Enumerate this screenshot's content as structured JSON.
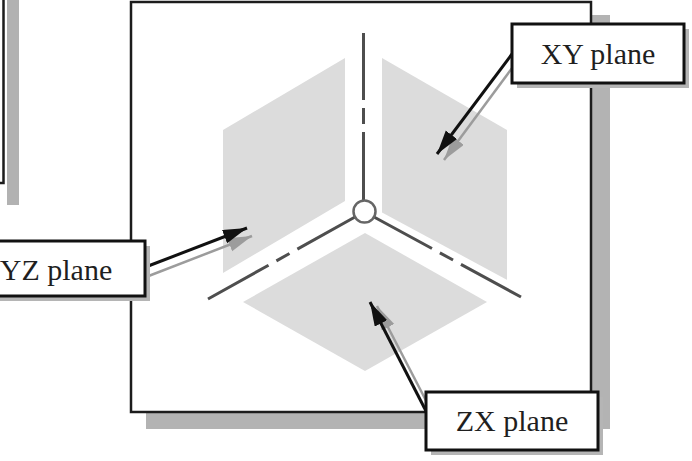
{
  "diagram": {
    "type": "isometric-datum-planes-figure",
    "labels": {
      "xy": "XY plane",
      "yz": "YZ plane",
      "zx": "ZX plane"
    },
    "colors": {
      "plane_fill": "#dcdcdc",
      "axis_line": "#4e4e4e",
      "origin_circle_stroke": "#666666",
      "box_border": "#1c1c1c",
      "box_drop_shadow": "#b3b3b3",
      "label_border": "#111111",
      "label_shadow": "#b5b5b5",
      "leader_line": "#111111",
      "leader_shadow_line": "#9c9c9c",
      "text": "#1f1f1f",
      "background": "#ffffff"
    }
  }
}
